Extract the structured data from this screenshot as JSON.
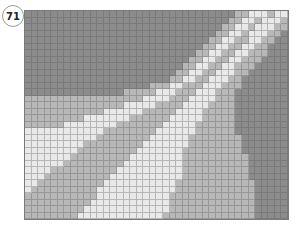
{
  "puzzle": {
    "number": "71",
    "columns": 40,
    "rows": 32,
    "palette": {
      "D": "#8c8c8c",
      "M": "#b8b8b8",
      "L": "#e9e9e9"
    },
    "grid_rows": [
      "DDDDDDDDDDDDDDDDDDDDDDDDDDDDDDDDMMLLLMLL",
      "DDDDDDDDDDDDDDDDDDDDDDDDDDDDDDDMMLLMLLLM",
      "DDDDDDDDDDDDDDDDDDDDDDDDDDDDDDMMLLMLLLMM",
      "DDDDDDDDDDDDDDDDDDDDDDDDDDDDDMMLLMLLLMMD",
      "DDDDDDDDDDDDDDDDDDDDDDDDDDDDMMLLMMLLMMDD",
      "DDDDDDDDDDDDDDDDDDDDDDDDDDDMMLLMMLLMMDDD",
      "DDDDDDDDDDDDDDDDDDDDDDDDDDMMLLMMLLMMMDDD",
      "DDDDDDDDDDDDDDDDDDDDDDDDDMMLLMMLLMMMDDDD",
      "DDDDDDDDDDDDDDDDDDDDDDDDMMLLMMLLMMMDDDDD",
      "DDDDDDDDDDDDDDDDDDDDDDDMMLLMMLLLMMDDDDDD",
      "DDDDDDDDDDDDDDDDDDDDDDMMLLMMLLLMMDDDDDDD",
      "DDDDDDDDDDDDDDDDDDDMMMLLMMMLLLMMMDDDDDDD",
      "DDDDDDDDDDDDDDDMMMMMLLLMMMLLLMMMDDDDDDDD",
      "MMMMMMMMMMMMMMMMMMLLLLMMMLLLLMMMDDDDDDDD",
      "MMMMMMMMMMMMMMMLLLLLMMMMLLLLMMMMDDDDDDDD",
      "MMMMMMMMMMMMLLLLLLMMMMMLLLLMMMMMDDDDDDDD",
      "MMMMMMMMMLLLLLLLMMMMMMLLLLLMMMMMDDDDDDDD",
      "MMMMMMLLLLLLLLMMMMMMMLLLLLMMMMMMDDDDDDDD",
      "LLLLLLLLLLLLMMMMMMMMLLLLLLMMMMMMDDDDDDDD",
      "LLLLLLLLLLLMMMMMMMMLLLLLLMMMMMMMMDDDDDDD",
      "LLLLLLLLLMMMMMMMMMLLLLLLLMMMMMMMMDDDDDDD",
      "LLLLLLLLMMMMMMMMMLLLLLLLMMMMMMMMMDDDDDDD",
      "LLLLLLLMMMMMMMMMLLLLLLLLMMMMMMMMMMDDDDDD",
      "LLLLLLMMMMMMMMMLLLLLLLLLMMMMMMMMMMDDDDDD",
      "LLLLMMMMMMMMMMLLLLLLLLLLMMMMMMMMMMDDDDDD",
      "LLLMMMMMMMMMMLLLLLLLLLLLMMMMMMMMMMDDDDDD",
      "LLMMMMMMMMMMLLLLLLLLLLLMMMMMMMMMMMMDDDDD",
      "LMMMMMMMMMMLLLLLLLLLLLLMMMMMMMMMMMMDDDDD",
      "MMMMMMMMMMMLLLLLLLLLLLMMMMMMMMMMMMMDDDDD",
      "MMMMMMMMMMLLLLLLLLLLLLMMMMMMMMMMMMMDDDDD",
      "MMMMMMMMMLLLLLLLLLLLLLMMMMMMMMMMMMMDDDDD",
      "MMMMMMMMLLLLLLLLLLLLLMMMMMMMMMMMMMMDDDDD"
    ]
  }
}
